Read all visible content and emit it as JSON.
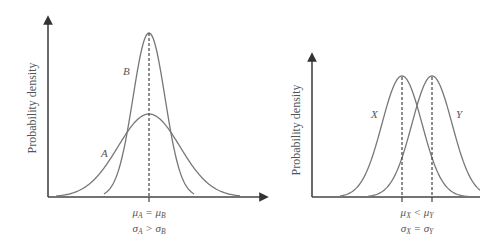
{
  "chart_data": [
    {
      "type": "line",
      "title": "",
      "xlabel": "",
      "ylabel": "Probability density",
      "grid": false,
      "description": "Two normal distributions with equal means and different standard deviations",
      "series": [
        {
          "name": "A",
          "mean": 0,
          "sd": "larger",
          "peak_relative": 0.55
        },
        {
          "name": "B",
          "mean": 0,
          "sd": "smaller",
          "peak_relative": 1.0
        }
      ],
      "annotations": [
        "μA = μB",
        "σA > σB"
      ],
      "mean_line": "dashed vertical line at shared mean"
    },
    {
      "type": "line",
      "title": "",
      "xlabel": "",
      "ylabel": "Probability density",
      "grid": false,
      "description": "Two normal distributions with equal standard deviations and different means",
      "series": [
        {
          "name": "X",
          "mean": "lower",
          "sd": "equal",
          "peak_relative": 1.0
        },
        {
          "name": "Y",
          "mean": "higher",
          "sd": "equal",
          "peak_relative": 1.0
        }
      ],
      "annotations": [
        "μX < μY",
        "σX = σY"
      ],
      "mean_line": "dashed vertical lines at each mean"
    }
  ],
  "left": {
    "ylabel": "Probability density",
    "curve_a": "A",
    "curve_b": "B",
    "eq1": {
      "l": "μ",
      "ls": "A",
      "op": " = ",
      "r": "μ",
      "rs": "B"
    },
    "eq2": {
      "l": "σ",
      "ls": "A",
      "op": " > ",
      "r": "σ",
      "rs": "B"
    }
  },
  "right": {
    "ylabel": "Probability density",
    "curve_x": "X",
    "curve_y": "Y",
    "eq1": {
      "l": "μ",
      "ls": "X",
      "op": " < ",
      "r": "μ",
      "rs": "Y"
    },
    "eq2": {
      "l": "σ",
      "ls": "X",
      "op": " = ",
      "r": "σ",
      "rs": "Y"
    }
  }
}
